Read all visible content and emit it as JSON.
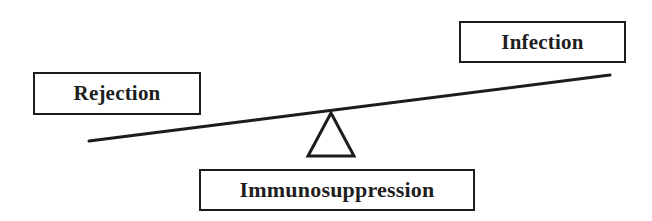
{
  "diagram": {
    "type": "seesaw-balance",
    "labels": {
      "left": "Rejection",
      "right": "Infection",
      "fulcrum": "Immunosuppression"
    },
    "colors": {
      "stroke": "#1c1c1c",
      "text": "#1e1e1e",
      "background": "#ffffff"
    }
  }
}
